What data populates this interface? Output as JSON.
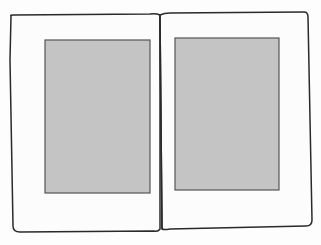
{
  "diagram": {
    "type": "open-book-page-spread",
    "colors": {
      "background": "#fdfdfd",
      "page": "#fcfcfc",
      "outline": "#2a2a2a",
      "text_block": "#c4c4c4",
      "text_block_border": "#555555"
    },
    "pages": [
      {
        "side": "left",
        "text_block": {
          "x": 45,
          "y": 40,
          "w": 105,
          "h": 153
        }
      },
      {
        "side": "right",
        "text_block": {
          "x": 175,
          "y": 38,
          "w": 104,
          "h": 152
        }
      }
    ]
  }
}
